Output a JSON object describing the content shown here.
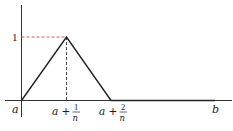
{
  "diagram": {
    "y_tick_label": "1",
    "x_labels": {
      "origin": "a",
      "peak": {
        "base": "a +",
        "numerator": "1",
        "denominator": "n"
      },
      "end": {
        "base": "a +",
        "numerator": "2",
        "denominator": "n"
      },
      "right": "b"
    },
    "colors": {
      "axis": "#333333",
      "curve": "#222222",
      "dashed_horizontal": "#e0505a",
      "dashed_vertical": "#333333"
    },
    "points": [
      {
        "x": "a",
        "y": 0
      },
      {
        "x": "a + 1/n",
        "y": 1
      },
      {
        "x": "a + 2/n",
        "y": 0
      },
      {
        "x": "b",
        "y": 0
      }
    ]
  }
}
